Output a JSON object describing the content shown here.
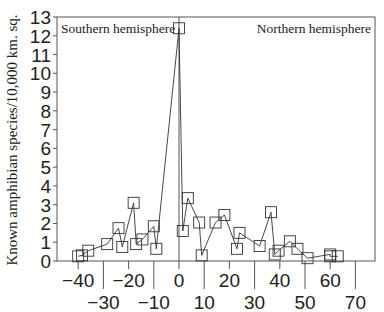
{
  "chart_data": {
    "type": "line",
    "title": "",
    "xlabel": "",
    "ylabel": "Known amphibian species/10,000 km. sq.",
    "xlim": [
      -45,
      75
    ],
    "ylim": [
      0,
      13
    ],
    "grid": false,
    "legend": null,
    "marker": "open-square",
    "line_color": "#333333",
    "x_ticks": [
      -40,
      -30,
      -20,
      -10,
      0,
      10,
      20,
      30,
      40,
      50,
      60,
      70
    ],
    "x_tick_labels": [
      "−40",
      "−30",
      "−20",
      "−10",
      "0",
      "10",
      "20",
      "30",
      "40",
      "50",
      "60",
      "70"
    ],
    "y_ticks": [
      0,
      1,
      2,
      3,
      4,
      5,
      6,
      7,
      8,
      9,
      10,
      11,
      12,
      13
    ],
    "y_tick_labels": [
      "0",
      "1",
      "2",
      "3",
      "4",
      "5",
      "6",
      "7",
      "8",
      "9",
      "10",
      "11",
      "12",
      "13"
    ],
    "annotations": [
      {
        "text": "Southern hemisphere",
        "position": "top-left"
      },
      {
        "text": "Northern hemisphere",
        "position": "top-right"
      }
    ],
    "equator_line_x": 0,
    "series": [
      {
        "name": "Known amphibian species density by latitude",
        "x": [
          -40,
          -38.5,
          -36,
          -28.5,
          -24,
          -22.5,
          -18,
          -17,
          -14.5,
          -10,
          -9,
          0,
          1.5,
          3.5,
          8,
          9,
          14.5,
          18,
          23,
          24,
          32,
          36.5,
          38,
          39.5,
          44,
          47,
          51,
          60,
          60,
          63
        ],
        "y": [
          0.25,
          0.3,
          0.55,
          0.9,
          1.75,
          0.75,
          3.1,
          0.9,
          1.15,
          1.85,
          0.65,
          12.4,
          1.6,
          3.35,
          2.05,
          0.3,
          2.05,
          2.45,
          0.65,
          1.5,
          0.8,
          2.6,
          0.35,
          0.55,
          1.05,
          0.65,
          0.15,
          0.35,
          0.25,
          0.25
        ]
      }
    ]
  }
}
